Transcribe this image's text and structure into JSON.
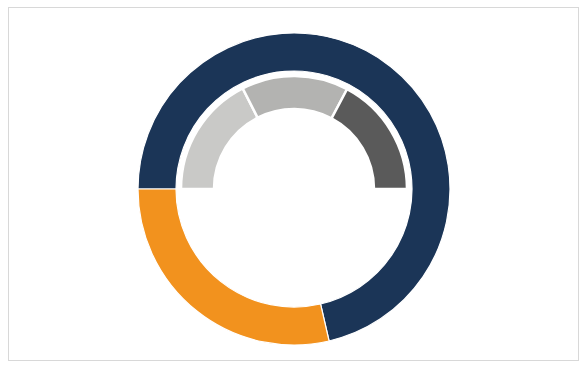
{
  "figure": {
    "background_color": "#ffffff",
    "border_color": "#d8d8d8",
    "width": 588,
    "height": 370
  },
  "chart_data": {
    "type": "pie",
    "title": "",
    "subtitle": "",
    "xlabel": "",
    "ylabel": "",
    "grid": false,
    "legend": "none",
    "variant": "nested-donut",
    "center": {
      "x": 294,
      "y": 189
    },
    "start_angle_deg": 180,
    "direction": "clockwise",
    "rings": [
      {
        "name": "outer",
        "ring_index": 0,
        "inner_radius": 118,
        "outer_radius": 156,
        "total_degrees": 360,
        "segments": [
          {
            "label": "Segment A",
            "color": "#1b3557",
            "value": 71.5,
            "percent": 19.9,
            "start_deg": 180,
            "end_deg": 437,
            "sweep_deg": 257
          },
          {
            "label": "Segment B",
            "color": "#f2921e",
            "value": 103,
            "percent": 28.6,
            "start_deg": 437,
            "end_deg": 540,
            "sweep_deg": 103
          }
        ]
      },
      {
        "name": "inner",
        "ring_index": 1,
        "inner_radius": 80,
        "outer_radius": 113,
        "total_degrees": 180,
        "segments": [
          {
            "label": "Segment C",
            "color": "#c9c9c7",
            "value": 63,
            "percent": 35.0,
            "start_deg": 180,
            "end_deg": 243,
            "sweep_deg": 63
          },
          {
            "label": "Segment D",
            "color": "#b3b3b1",
            "value": 55,
            "percent": 30.6,
            "start_deg": 243,
            "end_deg": 298,
            "sweep_deg": 55
          },
          {
            "label": "Segment E",
            "color": "#5a5a5a",
            "value": 62,
            "percent": 34.4,
            "start_deg": 298,
            "end_deg": 360,
            "sweep_deg": 62
          }
        ]
      }
    ],
    "colors": {
      "navy": "#1b3557",
      "orange": "#f2921e",
      "light_gray": "#c9c9c7",
      "mid_gray": "#b3b3b1",
      "dark_gray": "#5a5a5a",
      "divider": "#ffffff"
    }
  }
}
